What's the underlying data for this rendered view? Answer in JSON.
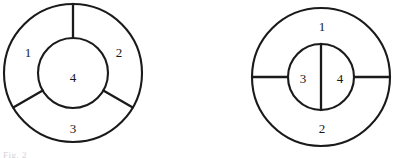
{
  "page": {
    "background_color": "#ffffff",
    "ink_color": "#1a1a1a",
    "width": 396,
    "height": 158
  },
  "figures": [
    {
      "id": "left-figure",
      "name": "annulus-with-three-outer-regions",
      "description": "Outer circle divided by a concentric inner circle and three radial spokes into three outer regions and one central region",
      "outer_circle": {
        "cx": 73,
        "cy": 73,
        "r": 69
      },
      "inner_circle": {
        "cx": 73,
        "cy": 73,
        "r": 35
      },
      "spoke_angles_deg": [
        90,
        210,
        330
      ],
      "labels": [
        {
          "text": "1",
          "x": 28,
          "y": 52
        },
        {
          "text": "2",
          "x": 119,
          "y": 52
        },
        {
          "text": "3",
          "x": 73,
          "y": 128
        },
        {
          "text": "4",
          "x": 73,
          "y": 77
        }
      ]
    },
    {
      "id": "right-figure",
      "name": "annulus-with-two-outer-two-inner-regions",
      "description": "Outer circle split horizontally into two regions; concentric inner circle split vertically into two regions",
      "outer_circle": {
        "cx": 321,
        "cy": 77,
        "r": 69
      },
      "inner_circle": {
        "cx": 321,
        "cy": 77,
        "r": 33
      },
      "outer_divider": "horizontal-diameter",
      "inner_divider": "vertical-diameter",
      "labels": [
        {
          "text": "1",
          "x": 322,
          "y": 26
        },
        {
          "text": "2",
          "x": 322,
          "y": 128
        },
        {
          "text": "3",
          "x": 303,
          "y": 78
        },
        {
          "text": "4",
          "x": 340,
          "y": 78
        }
      ]
    }
  ],
  "caption": {
    "fragment_text": "Fig. 2",
    "note": "cropped at bottom edge, barely legible"
  }
}
